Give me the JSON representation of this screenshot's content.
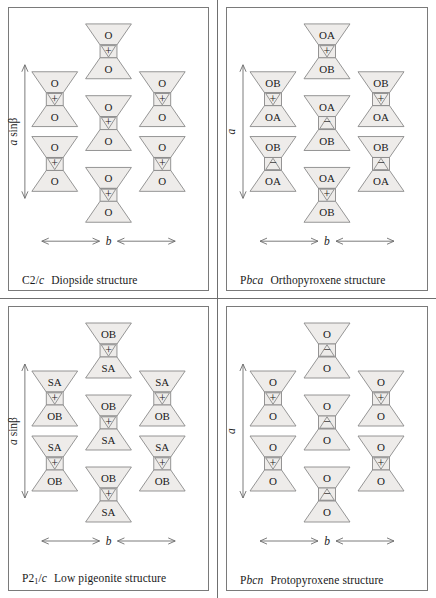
{
  "figure": {
    "type": "crystal-structure-diagram",
    "layout": "2x2 grid of pyroxene chain stacking diagrams",
    "colors": {
      "polyhedron_fill": "#eeecea",
      "polyhedron_stroke": "#8a8a8a",
      "frame_stroke": "#7a7a7a",
      "text": "#1a1a1a",
      "background": "#ffffff"
    }
  },
  "panels": [
    {
      "id": "c2c",
      "space_group_upright": "C2",
      "space_group_slash": "/",
      "space_group_italic": "c",
      "space_group_sub": "",
      "name": "Diopside structure",
      "vertical_axis_label": "a sinβ",
      "vertical_axis_italic": "a",
      "vertical_axis_rest": " sinβ",
      "horizontal_axis_label": "b",
      "columns": {
        "side": [
          {
            "top": "O",
            "sign": "+",
            "bottom": "O"
          },
          {
            "top": "O",
            "sign": "+",
            "bottom": "O"
          }
        ],
        "center": [
          {
            "top": "O",
            "sign": "+",
            "bottom": "O"
          },
          {
            "top": "O",
            "sign": "+",
            "bottom": "O"
          },
          {
            "top": "O",
            "sign": "+",
            "bottom": "O"
          }
        ]
      }
    },
    {
      "id": "pbca",
      "space_group_upright": "P",
      "space_group_slash": "",
      "space_group_italic": "bca",
      "space_group_sub": "",
      "name": "Orthopyroxene structure",
      "vertical_axis_label": "a",
      "vertical_axis_italic": "a",
      "vertical_axis_rest": "",
      "horizontal_axis_label": "b",
      "columns": {
        "side": [
          {
            "top": "OB",
            "sign": "+",
            "bottom": "OA"
          },
          {
            "top": "OB",
            "sign": "−",
            "bottom": "OA"
          }
        ],
        "center": [
          {
            "top": "OA",
            "sign": "+",
            "bottom": "OB"
          },
          {
            "top": "OA",
            "sign": "−",
            "bottom": "OB"
          },
          {
            "top": "OA",
            "sign": "+",
            "bottom": "OB"
          }
        ]
      }
    },
    {
      "id": "p21c",
      "space_group_upright": "P2",
      "space_group_slash": "/",
      "space_group_italic": "c",
      "space_group_sub": "1",
      "name": "Low pigeonite structure",
      "vertical_axis_label": "a sinβ",
      "vertical_axis_italic": "a",
      "vertical_axis_rest": " sinβ",
      "horizontal_axis_label": "b",
      "columns": {
        "side": [
          {
            "top": "SA",
            "sign": "+",
            "bottom": "OB"
          },
          {
            "top": "SA",
            "sign": "+",
            "bottom": "OB"
          }
        ],
        "center": [
          {
            "top": "OB",
            "sign": "+",
            "bottom": "SA"
          },
          {
            "top": "OB",
            "sign": "+",
            "bottom": "SA"
          },
          {
            "top": "OB",
            "sign": "+",
            "bottom": "SA"
          }
        ]
      }
    },
    {
      "id": "pbcn",
      "space_group_upright": "P",
      "space_group_slash": "",
      "space_group_italic": "bcn",
      "space_group_sub": "",
      "name": "Protopyroxene structure",
      "vertical_axis_label": "a",
      "vertical_axis_italic": "a",
      "vertical_axis_rest": "",
      "horizontal_axis_label": "b",
      "columns": {
        "side": [
          {
            "top": "O",
            "sign": "+",
            "bottom": "O"
          },
          {
            "top": "O",
            "sign": "+",
            "bottom": "O"
          }
        ],
        "center": [
          {
            "top": "O",
            "sign": "−",
            "bottom": "O"
          },
          {
            "top": "O",
            "sign": "−",
            "bottom": "O"
          },
          {
            "top": "O",
            "sign": "−",
            "bottom": "O"
          }
        ]
      }
    }
  ]
}
